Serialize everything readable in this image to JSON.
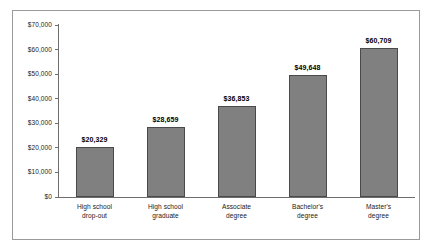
{
  "chart_data": {
    "type": "bar",
    "title": "",
    "subtitle": "",
    "xlabel": "",
    "ylabel": "",
    "categories": [
      "High school drop-out",
      "High school graduate",
      "Associate degree",
      "Bachelor's degree",
      "Master's degree"
    ],
    "category_lines": [
      [
        "High school",
        "drop-out"
      ],
      [
        "High school",
        "graduate"
      ],
      [
        "Associate",
        "degree"
      ],
      [
        "Bachelor's",
        "degree"
      ],
      [
        "Master's",
        "degree"
      ]
    ],
    "values": [
      20329,
      28659,
      36853,
      49648,
      60709
    ],
    "value_labels": [
      "$20,329",
      "$28,659",
      "$36,853",
      "$49,648",
      "$60,709"
    ],
    "ylim": [
      0,
      70000
    ],
    "ytick_values": [
      0,
      10000,
      20000,
      30000,
      40000,
      50000,
      60000,
      70000
    ],
    "ytick_labels": [
      "$0",
      "$10,000",
      "$20,000",
      "$30,000",
      "$40,000",
      "$50,000",
      "$60,000",
      "$70,000"
    ],
    "grid": false,
    "legend": null,
    "bar_color": "#808080",
    "bar_edge_color": "#4a4a4a",
    "axis_color": "#6e6e6e",
    "frame_color": "#9a9a9a",
    "text_color": "#1a1a1a"
  }
}
